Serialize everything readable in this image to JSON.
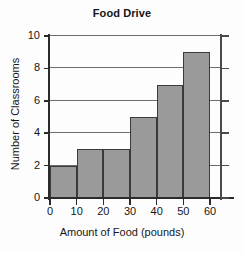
{
  "chart_data": {
    "type": "bar",
    "title": "Food Drive",
    "xlabel": "Amount of Food (pounds)",
    "ylabel": "Number of Classrooms",
    "categories": [
      "0-10",
      "10-20",
      "20-30",
      "30-40",
      "40-50",
      "50-60"
    ],
    "bin_edges": [
      0,
      10,
      20,
      30,
      40,
      50,
      60
    ],
    "values": [
      2,
      3,
      3,
      5,
      7,
      9
    ],
    "xlim": [
      0,
      60
    ],
    "ylim": [
      0,
      10
    ],
    "xticks": [
      "0",
      "10",
      "20",
      "30",
      "40",
      "50",
      "60"
    ],
    "yticks": [
      "0",
      "2",
      "4",
      "6",
      "8",
      "10"
    ],
    "grid": "horizontal",
    "legend": "none",
    "bar_color": "#9a9a9a",
    "bar_edge_color": "#3a3a3a",
    "axis_color": "#2b2b2b",
    "grid_color": "#6d6d6d",
    "background_color": "#fdfdfd"
  }
}
